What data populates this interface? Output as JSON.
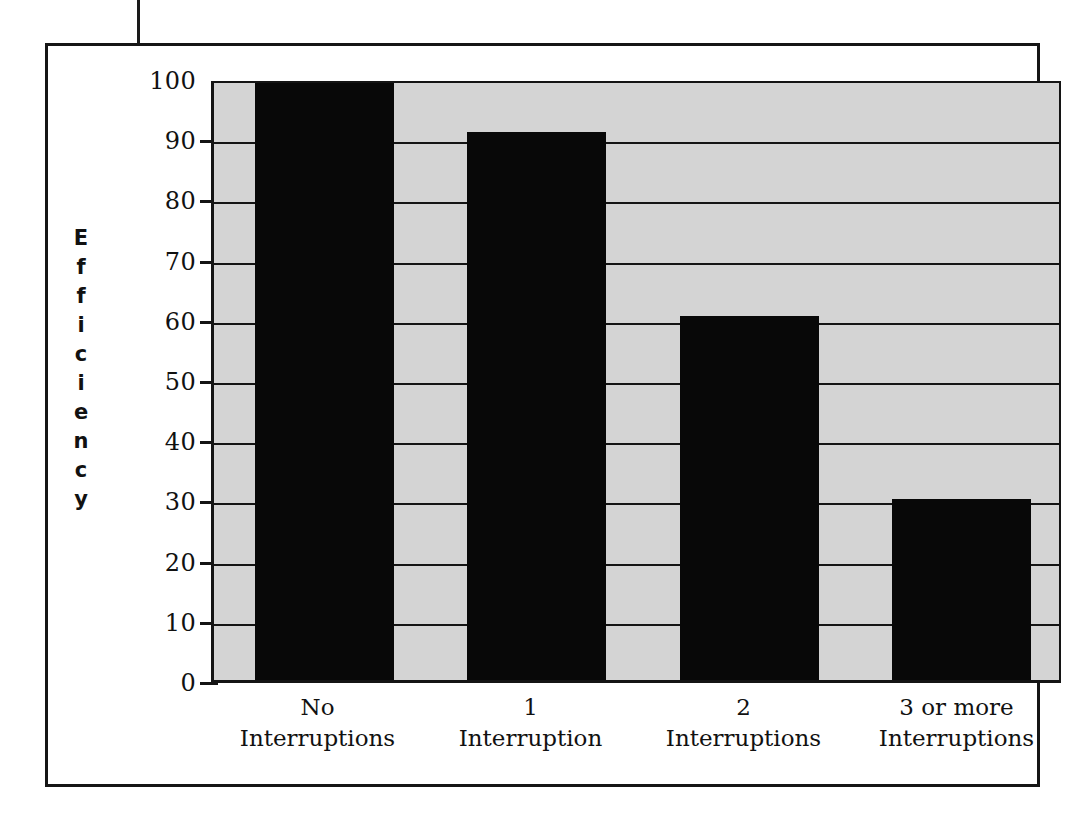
{
  "page": {
    "background_color": "#ffffff",
    "frame_color": "#161616"
  },
  "chart_data": {
    "type": "bar",
    "title": "",
    "subtitle": "",
    "xlabel": "",
    "ylabel": "Efficiency",
    "ylabel_letters": [
      "E",
      "f",
      "f",
      "i",
      "c",
      "i",
      "e",
      "n",
      "c",
      "y"
    ],
    "categories": [
      "No Interruptions",
      "1 Interruption",
      "2 Interruptions",
      "3 or more Interruptions"
    ],
    "category_lines": [
      {
        "line1": "No",
        "line2": "Interruptions"
      },
      {
        "line1": "1",
        "line2": "Interruption"
      },
      {
        "line1": "2",
        "line2": "Interruptions"
      },
      {
        "line1": "3 or more",
        "line2": "Interruptions"
      }
    ],
    "values": [
      100,
      91,
      60.5,
      30
    ],
    "ylim": [
      0,
      100
    ],
    "ytick_step": 10,
    "ytick_labels": [
      "100",
      "90",
      "80",
      "70",
      "60",
      "50",
      "40",
      "30",
      "20",
      "10",
      "0"
    ],
    "ytick_values": [
      100,
      90,
      80,
      70,
      60,
      50,
      40,
      30,
      20,
      10,
      0
    ],
    "grid": true,
    "grid_orientation": "horizontal",
    "legend": false,
    "legend_position": "none",
    "bar_color": "#080808",
    "plot_background_color": "#d4d4d4",
    "axis_color": "#141414"
  }
}
